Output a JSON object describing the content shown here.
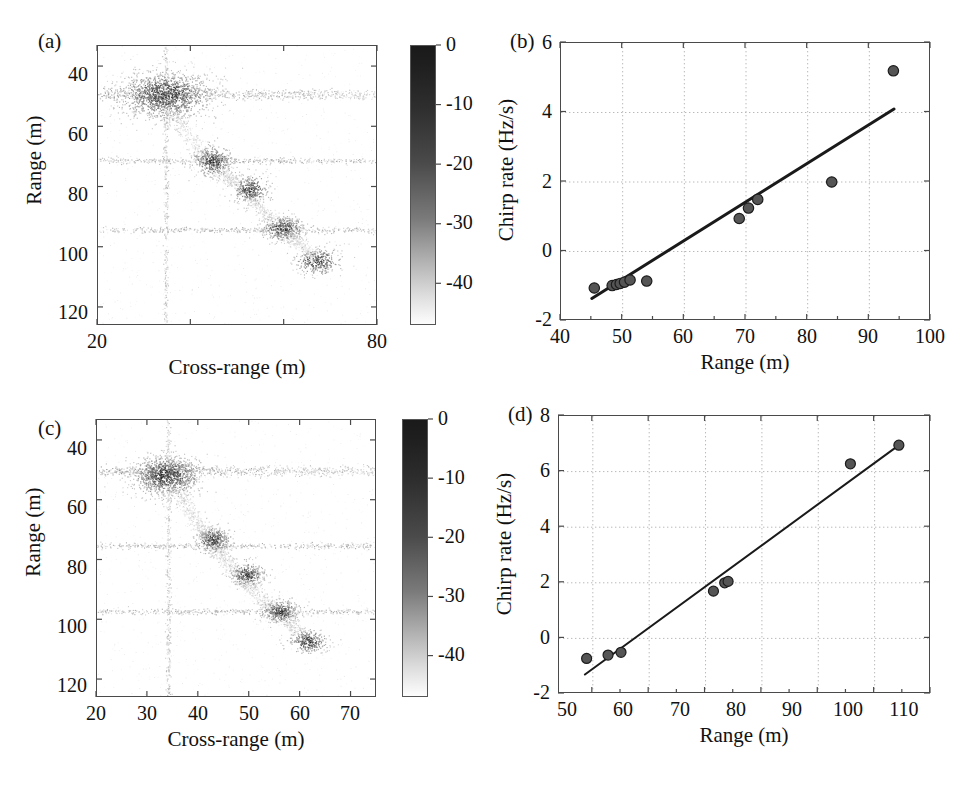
{
  "figure": {
    "width": 968,
    "height": 788,
    "background": "#ffffff",
    "ink_color": "#111111"
  },
  "panels": [
    {
      "key": "a",
      "label": "(a)",
      "type": "image-scatter",
      "xlabel": "Cross-range (m)",
      "ylabel": "Range (m)",
      "xticks": [
        20,
        40,
        60,
        80
      ],
      "xticklabels": [
        "20",
        "40",
        "60",
        "80"
      ],
      "yticks": [
        40,
        60,
        80,
        100,
        120
      ],
      "yticklabels": [
        "40",
        "60",
        "80",
        "100",
        "120"
      ],
      "xlim": [
        20,
        80
      ],
      "ylim_top": 33,
      "ylim_bottom": 126,
      "y_inverted": true,
      "colorbar": {
        "ticks": [
          0,
          -10,
          -20,
          -30,
          -40
        ],
        "ticklabels": [
          "0",
          "-10",
          "-20",
          "-30",
          "-40"
        ],
        "vmax": 0,
        "vmin": -47,
        "colormap": "gray-inverted",
        "top_color": "#1a1a1a",
        "bottom_color": "#ffffff"
      }
    },
    {
      "key": "b",
      "label": "(b)",
      "type": "scatter-with-fit",
      "xlabel": "Range (m)",
      "ylabel": "Chirp rate (Hz/s)",
      "xticks": [
        40,
        50,
        60,
        70,
        80,
        90,
        100
      ],
      "xticklabels": [
        "40",
        "50",
        "60",
        "70",
        "80",
        "90",
        "100"
      ],
      "yticks": [
        -2,
        0,
        2,
        4,
        6
      ],
      "yticklabels": [
        "-2",
        "0",
        "2",
        "4",
        "6"
      ],
      "xlim": [
        40,
        100
      ],
      "ylim": [
        -2,
        6
      ],
      "grid": true
    },
    {
      "key": "c",
      "label": "(c)",
      "type": "image-scatter",
      "xlabel": "Cross-range (m)",
      "ylabel": "Range (m)",
      "xticks": [
        20,
        30,
        40,
        50,
        60,
        70
      ],
      "xticklabels": [
        "20",
        "30",
        "40",
        "50",
        "60",
        "70"
      ],
      "yticks": [
        40,
        60,
        80,
        100,
        120
      ],
      "yticklabels": [
        "40",
        "60",
        "80",
        "100",
        "120"
      ],
      "xlim": [
        20,
        75
      ],
      "ylim_top": 33,
      "ylim_bottom": 126,
      "y_inverted": true,
      "colorbar": {
        "ticks": [
          0,
          -10,
          -20,
          -30,
          -40
        ],
        "ticklabels": [
          "0",
          "-10",
          "-20",
          "-30",
          "-40"
        ],
        "vmax": 0,
        "vmin": -47,
        "colormap": "gray-inverted",
        "top_color": "#1a1a1a",
        "bottom_color": "#ffffff"
      }
    },
    {
      "key": "d",
      "label": "(d)",
      "type": "scatter-with-fit",
      "xlabel": "Range (m)",
      "ylabel": "Chirp rate (Hz/s)",
      "xticks": [
        50,
        60,
        70,
        80,
        90,
        100,
        110
      ],
      "xticklabels": [
        "50",
        "60",
        "70",
        "80",
        "90",
        "100",
        "110"
      ],
      "yticks": [
        -2,
        0,
        2,
        4,
        6,
        8
      ],
      "yticklabels": [
        "-2",
        "0",
        "2",
        "4",
        "6",
        "8"
      ],
      "xlim": [
        44,
        110
      ],
      "ylim": [
        -2,
        8
      ],
      "grid": true
    }
  ],
  "chart_data": [
    {
      "panel": "a",
      "type": "heatmap",
      "title": "(a)",
      "xlabel": "Cross-range (m)",
      "ylabel": "Range (m)",
      "xlim": [
        20,
        80
      ],
      "ylim": [
        126,
        33
      ],
      "colorbar_label": "",
      "colorbar_range": [
        -47,
        0
      ],
      "grid": false,
      "description": "ISAR image: scattered point cloud in dB, dark = strong return",
      "scatterer_clusters": [
        {
          "cross_range": 34.5,
          "range": 49,
          "intensity": -6,
          "spread_x": 5.0,
          "spread_y": 4.0,
          "n": 1400
        },
        {
          "cross_range": 44.5,
          "range": 71,
          "intensity": -12,
          "spread_x": 2.2,
          "spread_y": 2.6,
          "n": 420
        },
        {
          "cross_range": 52.5,
          "range": 80.5,
          "intensity": -14,
          "spread_x": 2.0,
          "spread_y": 2.4,
          "n": 330
        },
        {
          "cross_range": 59.5,
          "range": 93.5,
          "intensity": -12,
          "spread_x": 2.3,
          "spread_y": 2.2,
          "n": 380
        },
        {
          "cross_range": 67.0,
          "range": 104.5,
          "intensity": -16,
          "spread_x": 2.4,
          "spread_y": 2.4,
          "n": 300
        }
      ],
      "streak_rows": [
        49,
        71,
        94
      ],
      "streak_column": 34.5,
      "connecting_arc": [
        [
          36,
          55
        ],
        [
          41,
          66
        ],
        [
          46,
          74
        ],
        [
          50,
          79
        ],
        [
          55,
          87
        ],
        [
          60,
          95
        ],
        [
          64,
          100
        ],
        [
          68,
          105
        ]
      ]
    },
    {
      "panel": "b",
      "type": "scatter",
      "title": "(b)",
      "xlabel": "Range (m)",
      "ylabel": "Chirp rate (Hz/s)",
      "xlim": [
        40,
        100
      ],
      "ylim": [
        -2,
        6
      ],
      "grid": true,
      "x": [
        45.4,
        48.3,
        49.0,
        49.6,
        50.3,
        51.2,
        53.9,
        68.9,
        70.4,
        71.9,
        83.9,
        93.9
      ],
      "y": [
        -1.05,
        -0.98,
        -0.95,
        -0.92,
        -0.88,
        -0.82,
        -0.85,
        0.95,
        1.25,
        1.5,
        2.0,
        5.2
      ],
      "series": [
        {
          "name": "Estimated chirp rate",
          "marker": "circle",
          "marker_color": "#555555",
          "marker_edge": "#1c1c1c",
          "values": [
            -1.05,
            -0.98,
            -0.95,
            -0.92,
            -0.88,
            -0.82,
            -0.85,
            0.95,
            1.25,
            1.5,
            2.0,
            5.2
          ]
        }
      ],
      "fit_line": {
        "name": "linear fit",
        "x_start": 45.0,
        "y_start": -1.35,
        "x_end": 94.0,
        "y_end": 4.1,
        "slope": 0.1112,
        "intercept": -6.35,
        "color": "#1a1a1a",
        "width": 3.0
      }
    },
    {
      "panel": "c",
      "type": "heatmap",
      "title": "(c)",
      "xlabel": "Cross-range (m)",
      "ylabel": "Range (m)",
      "xlim": [
        20,
        75
      ],
      "ylim": [
        126,
        33
      ],
      "colorbar_range": [
        -47,
        0
      ],
      "grid": false,
      "description": "ISAR image after motion compensation; tighter, better-focused scatterers",
      "scatterer_clusters": [
        {
          "cross_range": 33.5,
          "range": 51.5,
          "intensity": -8,
          "spread_x": 3.4,
          "spread_y": 3.4,
          "n": 1100
        },
        {
          "cross_range": 42.8,
          "range": 73.0,
          "intensity": -13,
          "spread_x": 1.7,
          "spread_y": 2.2,
          "n": 380
        },
        {
          "cross_range": 49.5,
          "range": 84.5,
          "intensity": -14,
          "spread_x": 1.7,
          "spread_y": 2.0,
          "n": 320
        },
        {
          "cross_range": 56.0,
          "range": 97.0,
          "intensity": -12,
          "spread_x": 1.9,
          "spread_y": 2.0,
          "n": 360
        },
        {
          "cross_range": 61.5,
          "range": 107.0,
          "intensity": -15,
          "spread_x": 2.0,
          "spread_y": 2.0,
          "n": 290
        }
      ],
      "streak_rows": [
        50,
        75,
        97
      ],
      "streak_column": 34.0,
      "connecting_arc": [
        [
          36,
          57
        ],
        [
          39,
          66
        ],
        [
          42,
          73
        ],
        [
          45,
          79
        ],
        [
          48,
          85
        ],
        [
          52,
          92
        ],
        [
          56,
          98
        ],
        [
          60,
          104
        ]
      ]
    },
    {
      "panel": "d",
      "type": "scatter",
      "title": "(d)",
      "xlabel": "Range (m)",
      "ylabel": "Chirp rate (Hz/s)",
      "xlim": [
        44,
        110
      ],
      "ylim": [
        -2,
        8
      ],
      "grid": true,
      "x": [
        48.9,
        52.7,
        55.0,
        71.4,
        73.4,
        74.0,
        95.7,
        104.3
      ],
      "y": [
        -0.72,
        -0.6,
        -0.5,
        1.7,
        2.0,
        2.05,
        6.28,
        6.95
      ],
      "series": [
        {
          "name": "Estimated chirp rate",
          "marker": "circle",
          "marker_color": "#555555",
          "marker_edge": "#1c1c1c",
          "values": [
            -0.72,
            -0.6,
            -0.5,
            1.7,
            2.0,
            2.05,
            6.28,
            6.95
          ]
        }
      ],
      "fit_line": {
        "name": "linear fit",
        "x_start": 48.6,
        "y_start": -1.3,
        "x_end": 104.5,
        "y_end": 6.98,
        "slope": 0.1481,
        "intercept": -8.5,
        "color": "#1a1a1a",
        "width": 2.0
      }
    }
  ]
}
